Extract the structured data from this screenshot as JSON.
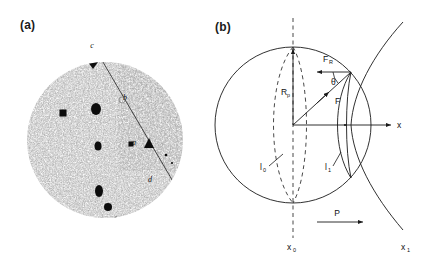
{
  "figure": {
    "panels": [
      {
        "id": "a",
        "label": "(a)",
        "type": "micrograph",
        "description": "grainy circular micrograph with dark precipitate spots aligned along a diagonal boundary line",
        "feature_labels": [
          {
            "text": "c",
            "x": 92,
            "y": 48
          },
          {
            "text": "b",
            "x": 125,
            "y": 100
          },
          {
            "text": "a",
            "x": 134,
            "y": 145
          },
          {
            "text": "d",
            "x": 150,
            "y": 182
          }
        ],
        "spots": [
          {
            "x": 93,
            "y": 62,
            "rx": 5.0,
            "ry": 7.0,
            "shape": "diamond"
          },
          {
            "x": 30,
            "y": 95,
            "rx": 2.0,
            "ry": 2.0,
            "shape": "dot"
          },
          {
            "x": 63,
            "y": 113,
            "rx": 3.5,
            "ry": 3.5,
            "shape": "dot"
          },
          {
            "x": 96,
            "y": 109,
            "rx": 5.0,
            "ry": 6.0,
            "shape": "blob"
          },
          {
            "x": 98,
            "y": 146,
            "rx": 3.5,
            "ry": 4.5,
            "shape": "blob"
          },
          {
            "x": 131,
            "y": 144,
            "rx": 2.5,
            "ry": 2.5,
            "shape": "square"
          },
          {
            "x": 149,
            "y": 143,
            "rx": 4.5,
            "ry": 4.5,
            "shape": "triangle"
          },
          {
            "x": 99,
            "y": 191,
            "rx": 4.0,
            "ry": 6.0,
            "shape": "blob"
          },
          {
            "x": 108,
            "y": 207,
            "rx": 4.0,
            "ry": 4.0,
            "shape": "dot"
          },
          {
            "x": 116,
            "y": 218,
            "rx": 1.5,
            "ry": 1.5,
            "shape": "dot"
          }
        ],
        "boundary_line": {
          "x1": 100,
          "y1": 57,
          "x2": 178,
          "y2": 190
        },
        "circle": {
          "cx": 105,
          "cy": 140,
          "r": 78
        }
      },
      {
        "id": "b",
        "label": "(b)",
        "type": "vector-diagram",
        "labels": {
          "radius": "R",
          "radius_sub": "p",
          "force": "F",
          "force_radial": "F",
          "force_radial_sub": "R",
          "angle": "θ",
          "axis_x": "x",
          "origin_x": "x",
          "origin_x_sub": "0",
          "end_x": "x",
          "end_x_sub": "1",
          "length_zero": "l",
          "length_zero_sub": "0",
          "length_one": "l",
          "length_one_sub": "1",
          "pressure": "P"
        }
      }
    ]
  },
  "colors": {
    "ink": "#111111",
    "line": "#1a1a1a",
    "grain_dark": "#555555",
    "background": "#ffffff"
  }
}
